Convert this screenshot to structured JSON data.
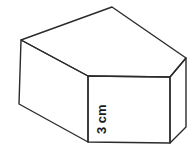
{
  "figure": {
    "kind": "pentagonal-prism-3d-diagram",
    "background_color": "#ffffff",
    "stroke_color": "#2b2b2b",
    "face_fill_color": "#ffffff",
    "stroke_width": 1.4,
    "canvas": {
      "width": 196,
      "height": 153
    },
    "labels": {
      "height_label": "3 cm"
    },
    "label_style": {
      "color": "#1a1a1a",
      "font_size_px": 13,
      "rotation_deg": -90
    },
    "vertices": {
      "top_left": {
        "x": 21,
        "y": 40
      },
      "top_apex": {
        "x": 112,
        "y": 7
      },
      "top_right": {
        "x": 186,
        "y": 58
      },
      "front_top_right": {
        "x": 170,
        "y": 77
      },
      "front_top_left": {
        "x": 88,
        "y": 76
      },
      "bottom_left": {
        "x": 19,
        "y": 104
      },
      "front_bottom_left": {
        "x": 88,
        "y": 142
      },
      "front_bottom_right": {
        "x": 170,
        "y": 143
      },
      "bottom_right": {
        "x": 186,
        "y": 127
      }
    },
    "faces": {
      "top": "21,40 112,7 186,58 170,77 88,76",
      "front": "88,76 170,77 170,143 88,142",
      "left": "21,40 88,76 88,142 19,104",
      "right": "170,77 186,58 186,127 170,143"
    }
  }
}
